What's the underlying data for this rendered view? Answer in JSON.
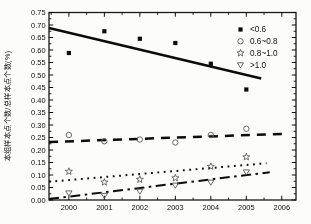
{
  "figure": {
    "bg": "#fcfcfb",
    "axis_color": "#1b1b1b",
    "text_color": "#101010",
    "marker_gray": "#666666",
    "line_black": "#0e0e0e"
  },
  "chart_data": {
    "type": "scatter",
    "title": "",
    "xlabel": "",
    "ylabel": "本组样本点个数/总样本点个数(%)",
    "xlim": [
      1999.44,
      2006.4
    ],
    "ylim": [
      0,
      0.75
    ],
    "grid": false,
    "xticks": [
      2000,
      2001,
      2002,
      2003,
      2004,
      2005,
      2006
    ],
    "ytick_labels": [
      "0.00",
      "0.05",
      "0.10",
      "0.15",
      "0.20",
      "0.25",
      "0.30",
      "0.35",
      "0.40",
      "0.45",
      "0.50",
      "0.55",
      "0.60",
      "0.65",
      "0.70",
      "0.75"
    ],
    "ytick_values": [
      0,
      0.05,
      0.1,
      0.15,
      0.2,
      0.25,
      0.3,
      0.35,
      0.4,
      0.45,
      0.5,
      0.55,
      0.6,
      0.65,
      0.7,
      0.75
    ],
    "x": [
      2000,
      2001,
      2002,
      2003,
      2004,
      2005
    ],
    "legend": {
      "position": "top-right"
    },
    "series": [
      {
        "name": "<0.6",
        "marker": "filled-square",
        "line_style": "solid",
        "values": [
          0.588,
          0.675,
          0.645,
          0.628,
          0.545,
          0.442
        ],
        "trend": {
          "x": [
            1999.44,
            2005.42
          ],
          "y": [
            0.688,
            0.486
          ]
        }
      },
      {
        "name": "0.6~0.8",
        "marker": "open-circle",
        "line_style": "dashed",
        "values": [
          0.26,
          0.235,
          0.242,
          0.23,
          0.26,
          0.285
        ],
        "trend": {
          "x": [
            1999.44,
            2006.15
          ],
          "y": [
            0.232,
            0.265
          ]
        }
      },
      {
        "name": "0.8~1.0",
        "marker": "open-star",
        "line_style": "dotted",
        "values": [
          0.114,
          0.071,
          0.082,
          0.088,
          0.134,
          0.172
        ],
        "trend": {
          "x": [
            1999.44,
            2005.57
          ],
          "y": [
            0.073,
            0.147
          ]
        }
      },
      {
        "name": ">1.0",
        "marker": "open-triangle-down",
        "line_style": "dashdot",
        "values": [
          0.028,
          0.018,
          0.035,
          0.059,
          0.071,
          0.112
        ],
        "trend": {
          "x": [
            1999.44,
            2005.66
          ],
          "y": [
            0.004,
            0.111
          ]
        }
      }
    ]
  }
}
